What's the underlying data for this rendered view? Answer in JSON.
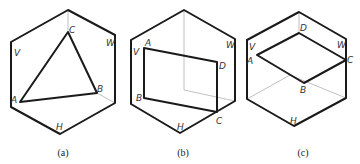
{
  "figures": [
    {
      "id": "a",
      "caption": "(a)",
      "plane_labels": {
        "v": "V",
        "w": "W",
        "h": "H"
      },
      "points": {
        "A": "A",
        "B": "B",
        "C": "C"
      },
      "shape": "triangle ABC"
    },
    {
      "id": "b",
      "caption": "(b)",
      "plane_labels": {
        "v": "V",
        "w": "W",
        "h": "H"
      },
      "points": {
        "A": "A",
        "B": "B",
        "C": "C",
        "D": "D"
      },
      "shape": "quadrilateral ABCD (vertical plane)"
    },
    {
      "id": "c",
      "caption": "(c)",
      "plane_labels": {
        "v": "V",
        "w": "W",
        "h": "H"
      },
      "points": {
        "A": "A",
        "B": "B",
        "C": "C",
        "D": "D"
      },
      "shape": "quadrilateral ABCD (horizontal plane)"
    }
  ]
}
